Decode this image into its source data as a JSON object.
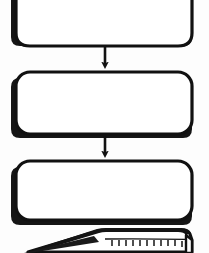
{
  "diagram": {
    "style": "scanned black-and-white line art, rounded rectangles with heavy drop shadows",
    "background_color": "#fdfdfd",
    "stroke_color": "#111111",
    "shadow_color": "#111111",
    "fill_color": "#ffffff",
    "canvas": {
      "width": 209,
      "height": 253
    },
    "nodes": [
      {
        "id": "step-1",
        "shape": "rounded-rectangle",
        "label": "",
        "clipped": "top",
        "x": 16,
        "y": -24,
        "width": 176,
        "height": 72,
        "radius": 14
      },
      {
        "id": "step-2",
        "shape": "rounded-rectangle",
        "label": "",
        "clipped": "none",
        "x": 16,
        "y": 72,
        "width": 176,
        "height": 65,
        "radius": 14
      },
      {
        "id": "step-3",
        "shape": "rounded-rectangle",
        "label": "",
        "clipped": "none",
        "x": 16,
        "y": 161,
        "width": 176,
        "height": 61,
        "radius": 14
      },
      {
        "id": "document-stack",
        "shape": "book-stack",
        "label": "",
        "clipped": "bottom",
        "x": 24,
        "y": 228,
        "width": 170,
        "height": 40
      }
    ],
    "connectors": [
      {
        "id": "arrow-1",
        "from": "step-1",
        "to": "step-2",
        "type": "straight-vertical-arrow",
        "arrowhead": "solid-triangle",
        "x": 105,
        "y_start": 48,
        "y_end": 72
      },
      {
        "id": "arrow-2",
        "from": "step-2",
        "to": "step-3",
        "type": "straight-vertical-arrow",
        "arrowhead": "solid-triangle",
        "x": 105,
        "y_start": 137,
        "y_end": 161
      }
    ]
  }
}
